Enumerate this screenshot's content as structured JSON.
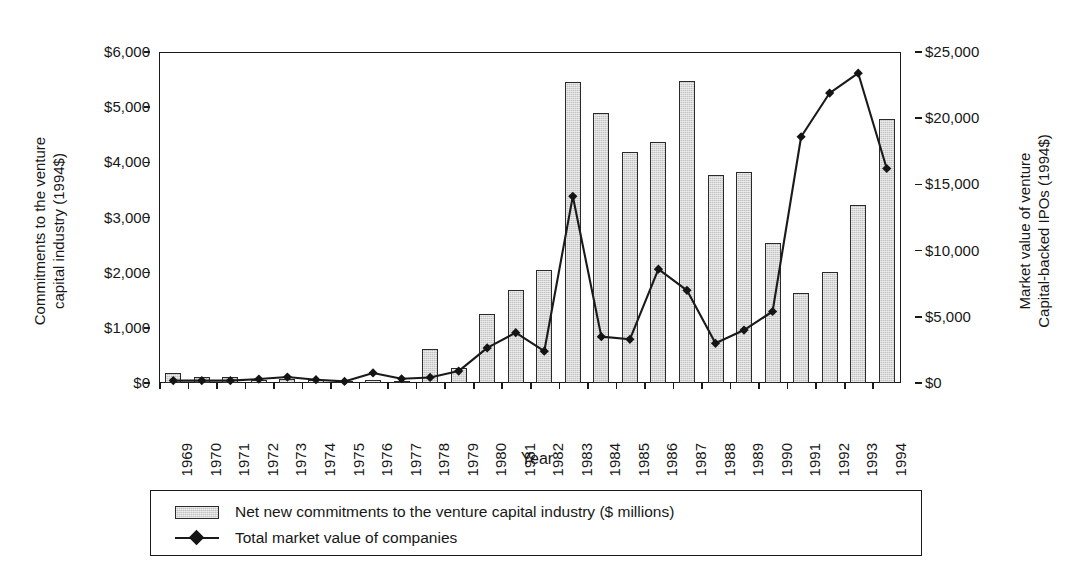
{
  "chart_data": {
    "type": "bar",
    "title": "",
    "xlabel": "Year",
    "ylabel": "Commitments to the venture\ncapital industry (1994$)",
    "ylabel_right": "Market value of venture\nCapital-backed IPOs (1994$)",
    "categories": [
      "1969",
      "1970",
      "1971",
      "1972",
      "1973",
      "1974",
      "1975",
      "1976",
      "1977",
      "1978",
      "1979",
      "1980",
      "1981",
      "1982",
      "1983",
      "1984",
      "1985",
      "1986",
      "1987",
      "1988",
      "1989",
      "1990",
      "1991",
      "1992",
      "1993",
      "1994"
    ],
    "ylim": [
      0,
      6000
    ],
    "ylim_right": [
      0,
      25000
    ],
    "yticks": [
      "$0",
      "$1,000",
      "$2,000",
      "$3,000",
      "$4,000",
      "$5,000",
      "$6,000"
    ],
    "ytick_values": [
      0,
      1000,
      2000,
      3000,
      4000,
      5000,
      6000
    ],
    "yticks_right": [
      "$0",
      "$5,000",
      "$10,000",
      "$15,000",
      "$20,000",
      "$25,000"
    ],
    "ytick_values_right": [
      0,
      5000,
      10000,
      15000,
      20000,
      25000
    ],
    "grid": false,
    "legend_position": "below-plot",
    "series": [
      {
        "name": "Net new commitments to the venture capital industry ($ millions)",
        "type": "bar",
        "axis": "left",
        "color": "#c2c2c2",
        "edge_color": "#2a2a2a",
        "values": [
          180,
          105,
          100,
          55,
          70,
          50,
          20,
          55,
          45,
          620,
          280,
          1260,
          1690,
          2050,
          5450,
          4890,
          4190,
          4370,
          5470,
          3770,
          3820,
          2530,
          1630,
          2010,
          3220,
          4790
        ]
      },
      {
        "name": "Total market value of companies",
        "type": "line",
        "axis": "right",
        "color": "#1a1a1a",
        "marker": "diamond",
        "values": [
          180,
          180,
          180,
          300,
          450,
          250,
          120,
          760,
          320,
          420,
          900,
          2650,
          3800,
          2400,
          14100,
          3500,
          3300,
          8600,
          7000,
          3000,
          4000,
          5400,
          18600,
          21900,
          23400,
          16200
        ]
      }
    ]
  },
  "legend": {
    "items": [
      {
        "key": "swatch",
        "label": "Net new commitments to the venture capital industry ($ millions)"
      },
      {
        "key": "line",
        "label": "Total market value of companies"
      }
    ]
  }
}
